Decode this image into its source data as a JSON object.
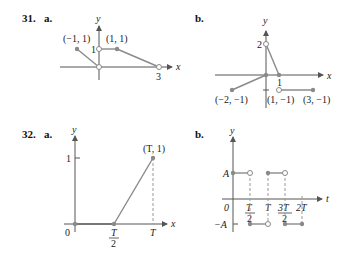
{
  "problems": [
    {
      "number": "31.",
      "parts": [
        {
          "part": "a.",
          "axis_labels": {
            "x": "x",
            "y": "y"
          },
          "tick_labels": {
            "y1": "1",
            "x3": "3"
          },
          "point_labels": [
            "(−1, 1)",
            "(1, 1)"
          ]
        },
        {
          "part": "b.",
          "axis_labels": {
            "x": "x",
            "y": "y"
          },
          "tick_labels": {
            "y2": "2",
            "x1": "1"
          },
          "point_labels": [
            "(−2, −1)",
            "(1, −1)",
            "(3, −1)"
          ]
        }
      ]
    },
    {
      "number": "32.",
      "parts": [
        {
          "part": "a.",
          "axis_labels": {
            "x": "x",
            "y": "y"
          },
          "tick_labels": {
            "origin": "0",
            "y1": "1",
            "xhalf_num": "T",
            "xhalf_den": "2",
            "xT": "T"
          },
          "point_labels": [
            "(T, 1)"
          ]
        },
        {
          "part": "b.",
          "axis_labels": {
            "x": "t",
            "y": "y"
          },
          "tick_labels": {
            "origin": "0",
            "yA": "A",
            "yneg": "−A",
            "xhalf_num": "T",
            "xhalf_den": "2",
            "xT": "T",
            "x3half_num": "3T",
            "x3half_den": "2",
            "x2T": "2T"
          }
        }
      ]
    }
  ]
}
